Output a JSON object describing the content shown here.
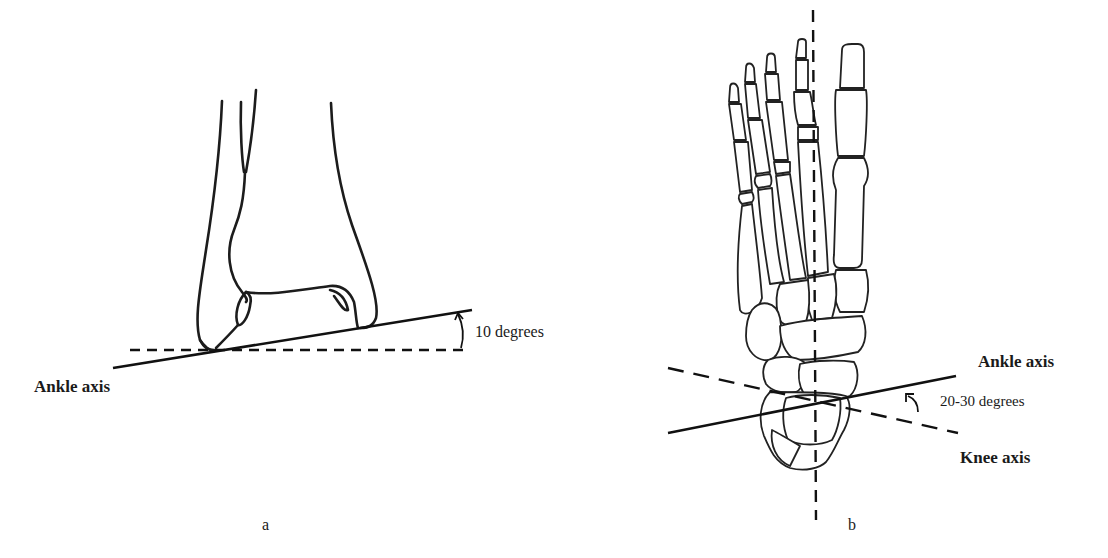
{
  "figure_a": {
    "panel_label": "a",
    "axis_label": "Ankle axis",
    "angle_label": "10 degrees",
    "angle_value_deg": 10,
    "reference_line": "horizontal dashed"
  },
  "figure_b": {
    "panel_label": "b",
    "ankle_axis_label": "Ankle axis",
    "knee_axis_label": "Knee axis",
    "angle_label": "20-30 degrees",
    "angle_range_deg": [
      20,
      30
    ],
    "reference_line": "vertical dashed"
  },
  "colors": {
    "ink": "#1c1c1c",
    "background": "#ffffff"
  }
}
